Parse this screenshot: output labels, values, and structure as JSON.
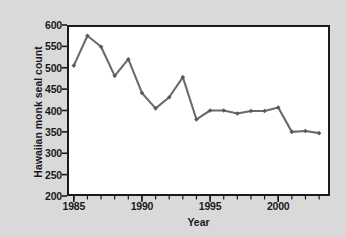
{
  "chart_data": {
    "type": "line",
    "title": "",
    "xlabel": "Year",
    "ylabel": "Hawaiian monk seal count",
    "xlim": [
      1984.5,
      2003.8
    ],
    "ylim": [
      200,
      600
    ],
    "ytick_labels": [
      "600",
      "550",
      "500",
      "450",
      "400",
      "350",
      "300",
      "250",
      "200"
    ],
    "ytick_values": [
      600,
      550,
      500,
      450,
      400,
      350,
      300,
      250,
      200
    ],
    "xtick_labels": [
      "1985",
      "1990",
      "1995",
      "2000"
    ],
    "xtick_values": [
      1985,
      1990,
      1995,
      2000
    ],
    "xtick_minor_values": [
      1985,
      1986,
      1987,
      1988,
      1989,
      1990,
      1991,
      1992,
      1993,
      1994,
      1995,
      1996,
      1997,
      1998,
      1999,
      2000,
      2001,
      2002,
      2003
    ],
    "grid": false,
    "legend": false,
    "x": [
      1985,
      1986,
      1987,
      1988,
      1989,
      1990,
      1991,
      1992,
      1993,
      1994,
      1995,
      1996,
      1997,
      1998,
      1999,
      2000,
      2001,
      2002,
      2003
    ],
    "values": [
      505,
      575,
      549,
      481,
      520,
      441,
      405,
      431,
      478,
      379,
      400,
      400,
      393,
      399,
      399,
      407,
      350,
      352,
      347
    ],
    "series_name": "Hawaiian monk seal count",
    "line_color": "#6b6b6b",
    "marker": "diamond",
    "marker_color": "#5a5a5a",
    "axis_color": "#1a1a1a",
    "plot_background": "#ffffff",
    "figure_background": "#d9d9d9"
  }
}
